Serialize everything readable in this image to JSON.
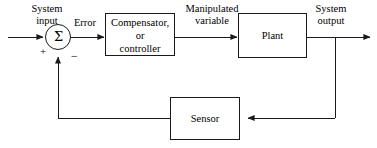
{
  "diagram": {
    "type": "block-diagram",
    "colors": {
      "line": "#1a1a1a",
      "text": "#000000",
      "background": "#ffffff"
    },
    "blocks": [
      {
        "id": "compensator",
        "label": "Compensator, or controller",
        "lines": [
          "Compensator,",
          "or",
          "controller"
        ],
        "shape": "rectangle",
        "x": 105,
        "y": 13,
        "width": 70,
        "height": 43
      },
      {
        "id": "plant",
        "label": "Plant",
        "lines": [
          "Plant"
        ],
        "shape": "rectangle",
        "x": 238,
        "y": 13,
        "width": 69,
        "height": 45
      },
      {
        "id": "sensor",
        "label": "Sensor",
        "lines": [
          "Sensor"
        ],
        "shape": "rectangle",
        "x": 170,
        "y": 97,
        "width": 70,
        "height": 43
      },
      {
        "id": "summing-junction",
        "label": "Σ",
        "shape": "circle",
        "cx": 58,
        "cy": 37,
        "r": 13,
        "signs": {
          "positive": "+",
          "negative": "−"
        }
      }
    ],
    "signals": [
      {
        "id": "system-input",
        "label": "System input",
        "lines": [
          "System",
          "input"
        ]
      },
      {
        "id": "error",
        "label": "Error",
        "lines": [
          "Error"
        ]
      },
      {
        "id": "manipulated-variable",
        "label": "Manipulated variable",
        "lines": [
          "Manipulated",
          "variable"
        ]
      },
      {
        "id": "system-output",
        "label": "System output",
        "lines": [
          "System",
          "output"
        ]
      }
    ],
    "connections": [
      {
        "from": "system-input",
        "to": "summing-junction",
        "arrow": true,
        "direction": "right"
      },
      {
        "from": "summing-junction",
        "to": "compensator",
        "arrow": true,
        "direction": "right"
      },
      {
        "from": "compensator",
        "to": "plant",
        "arrow": true,
        "direction": "right"
      },
      {
        "from": "plant",
        "to": "system-output",
        "arrow": true,
        "direction": "right"
      },
      {
        "from": "system-output",
        "to": "sensor",
        "arrow": true,
        "direction": "left"
      },
      {
        "from": "sensor",
        "to": "summing-junction",
        "arrow": true,
        "direction": "up"
      }
    ]
  }
}
